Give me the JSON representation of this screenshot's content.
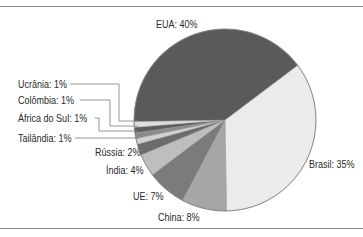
{
  "chart_data": {
    "type": "pie",
    "title": "",
    "center": [
      225,
      120
    ],
    "radius": 91,
    "start_angle_deg": 53,
    "direction": "clockwise",
    "slices": [
      {
        "label": "Brasil",
        "value": 35,
        "text": "Brasil: 35%",
        "color": "#ebebeb"
      },
      {
        "label": "China",
        "value": 8,
        "text": "China: 8%",
        "color": "#a6a6a6"
      },
      {
        "label": "UE",
        "value": 7,
        "text": "UE: 7%",
        "color": "#7b7b7b"
      },
      {
        "label": "Índia",
        "value": 4,
        "text": "Índia: 4%",
        "color": "#bebebe"
      },
      {
        "label": "Rússia",
        "value": 2,
        "text": "Rússia: 2%",
        "color": "#6c6c6c"
      },
      {
        "label": "Tailândia",
        "value": 1,
        "text": "Tailândia: 1%",
        "color": "#d2d2d2"
      },
      {
        "label": "África do Sul",
        "value": 1,
        "text": "África do Sul: 1%",
        "color": "#8c8c8c"
      },
      {
        "label": "Colômbia",
        "value": 1,
        "text": "Colômbia: 1%",
        "color": "#5e5e5e"
      },
      {
        "label": "Ucrânia",
        "value": 1,
        "text": "Ucrânia: 1%",
        "color": "#dedede"
      },
      {
        "label": "EUA",
        "value": 40,
        "text": "EUA: 40%",
        "color": "#5a5a5a"
      }
    ],
    "labels": [
      {
        "text": "EUA: 40%",
        "x": 156,
        "y": 28
      },
      {
        "text": "Brasil: 35%",
        "x": 309,
        "y": 168
      },
      {
        "text": "China: 8%",
        "x": 158,
        "y": 221
      },
      {
        "text": "UE: 7%",
        "x": 133,
        "y": 200
      },
      {
        "text": "Índia: 4%",
        "x": 106,
        "y": 174
      },
      {
        "text": "Rússia: 2%",
        "x": 95,
        "y": 156
      },
      {
        "text": "Ucrânia: 1%",
        "x": 18,
        "y": 88
      },
      {
        "text": "Colômbia: 1%",
        "x": 18,
        "y": 104
      },
      {
        "text": "África do Sul: 1%",
        "x": 18,
        "y": 122
      },
      {
        "text": "Tailândia: 1%",
        "x": 18,
        "y": 142
      }
    ],
    "leader_lines": [
      {
        "for": "Ucrânia",
        "points": [
          [
            70,
            84
          ],
          [
            119,
            84
          ],
          [
            119,
            121
          ],
          [
            138,
            121
          ]
        ]
      },
      {
        "for": "Colômbia",
        "points": [
          [
            80,
            100
          ],
          [
            110,
            100
          ],
          [
            110,
            126
          ],
          [
            138,
            126
          ]
        ]
      },
      {
        "for": "África do Sul",
        "points": [
          [
            95,
            118
          ],
          [
            99,
            118
          ],
          [
            99,
            131
          ],
          [
            138,
            131
          ]
        ]
      },
      {
        "for": "Tailândia",
        "points": [
          [
            75,
            138
          ],
          [
            139,
            138
          ]
        ]
      }
    ],
    "legend": null
  }
}
